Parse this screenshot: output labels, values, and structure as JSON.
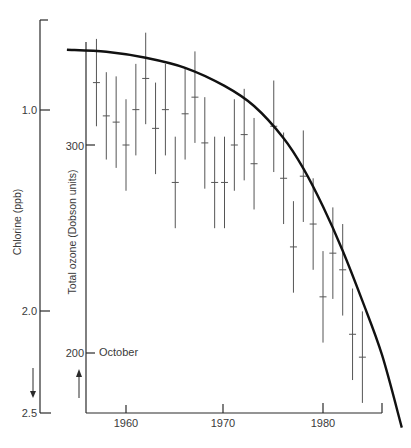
{
  "chart_data": {
    "type": "scatter",
    "title": "",
    "xlabel": "",
    "x_ticks": [
      "1960",
      "1970",
      "1980"
    ],
    "xlim": [
      1956,
      1986
    ],
    "left_axis": {
      "label": "Chlorine (ppb)",
      "ticks": [
        "1.0",
        "2.0",
        "2.5"
      ],
      "inverted": true,
      "range": [
        0.5,
        2.5
      ],
      "arrow": "down"
    },
    "inner_axis": {
      "label": "Total ozone (Dobson units)",
      "ticks": [
        "300",
        "200"
      ],
      "range": [
        175,
        350
      ],
      "arrow": "up",
      "annotation": "October"
    },
    "series": [
      {
        "name": "Total ozone (October, Dobson units)",
        "kind": "errorbar",
        "x": [
          1957,
          1958,
          1959,
          1960,
          1961,
          1962,
          1963,
          1964,
          1965,
          1966,
          1967,
          1968,
          1969,
          1970,
          1971,
          1972,
          1973,
          1975,
          1976,
          1977,
          1978,
          1979,
          1980,
          1981,
          1982,
          1983,
          1984
        ],
        "values": [
          330,
          314,
          311,
          300,
          317,
          332,
          308,
          317,
          282,
          315,
          323,
          301,
          282,
          282,
          300,
          305,
          291,
          309,
          284,
          251,
          285,
          262,
          227,
          248,
          240,
          209,
          198
        ],
        "error": [
          21,
          21,
          22,
          22,
          22,
          22,
          22,
          22,
          22,
          22,
          22,
          22,
          22,
          22,
          22,
          22,
          22,
          22,
          22,
          22,
          22,
          22,
          22,
          22,
          22,
          22,
          22
        ]
      },
      {
        "name": "Chlorine (ppb)",
        "kind": "line",
        "x": [
          1954,
          1958,
          1962,
          1966,
          1970,
          1973,
          1976,
          1978,
          1980,
          1982,
          1984,
          1986,
          1988
        ],
        "values": [
          0.7,
          0.71,
          0.74,
          0.79,
          0.88,
          0.98,
          1.14,
          1.29,
          1.48,
          1.7,
          1.95,
          2.22,
          2.58
        ]
      }
    ],
    "grid": false,
    "legend": "none"
  }
}
